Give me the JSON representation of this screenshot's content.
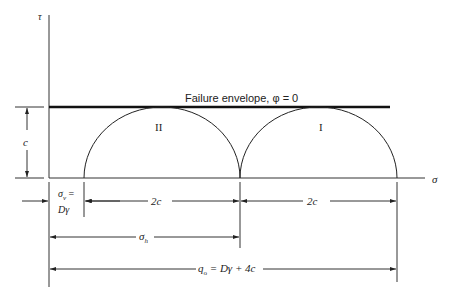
{
  "diagram": {
    "type": "Mohr circles (phi = 0 failure envelope)",
    "axes": {
      "y_label": "τ",
      "x_label": "σ"
    },
    "envelope_label": "Failure envelope, φ = 0",
    "circles": [
      {
        "id": "II",
        "label": "II"
      },
      {
        "id": "I",
        "label": "I"
      }
    ],
    "cohesion_label": "c",
    "dimensions": {
      "sigma_v_line1": "σ",
      "sigma_v_sub": "v",
      "sigma_v_eq": " =",
      "sigma_v_line2": "Dγ",
      "two_c_left": "2c",
      "two_c_right": "2c",
      "sigma_h": "σ",
      "sigma_h_sub": "h",
      "q0": "q",
      "q0_sub": "o",
      "q0_expr": " = Dγ + 4c"
    }
  }
}
